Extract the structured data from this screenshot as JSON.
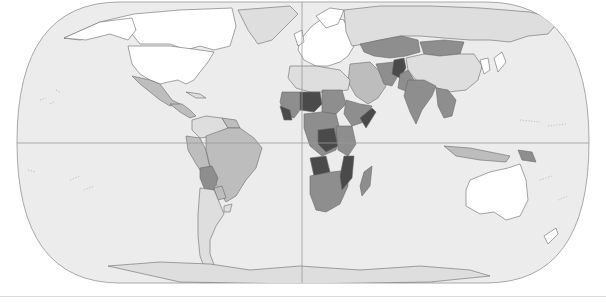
{
  "map": {
    "type": "choropleth",
    "projection": "robinson",
    "colors": {
      "ocean": "#ececec",
      "outline": "#a8a8a8",
      "graticule": "#9a9a9a",
      "border": "#6a6a6a",
      "class_1": "#ffffff",
      "class_2": "#dedede",
      "class_3": "#bdbdbd",
      "class_4": "#8e8e8e",
      "class_5": "#4a4a4a"
    },
    "equator_y": 143,
    "prime_meridian_x": 302,
    "regions": [
      {
        "name": "greenland",
        "class": "class_2",
        "d": "M238,10 L290,6 L298,14 L286,26 L272,40 L258,44 L248,30 Z"
      },
      {
        "name": "canada",
        "class": "class_1",
        "d": "M64,38 L100,22 L134,14 L180,10 L232,8 L236,26 L230,46 L214,50 L200,46 L186,50 L170,44 L140,44 L132,34 L110,32 L80,40 Z"
      },
      {
        "name": "alaska",
        "class": "class_1",
        "d": "M64,38 L100,22 L132,18 L136,30 L128,40 L110,34 L86,40 Z"
      },
      {
        "name": "usa",
        "class": "class_1",
        "d": "M128,46 L170,46 L200,50 L214,52 L208,62 L200,72 L194,80 L186,84 L178,80 L168,82 L160,84 L150,80 L140,74 L132,64 Z"
      },
      {
        "name": "mexico",
        "class": "class_3",
        "d": "M132,76 L150,80 L160,84 L166,92 L172,100 L180,104 L170,106 L160,100 L150,92 L140,84 Z"
      },
      {
        "name": "central-america",
        "class": "class_3",
        "d": "M170,104 L182,104 L190,110 L196,116 L190,118 L180,112 Z"
      },
      {
        "name": "cuba-caribbean",
        "class": "class_2",
        "d": "M186,92 L200,94 L206,98 L196,98 Z"
      },
      {
        "name": "colombia-venezuela",
        "class": "class_2",
        "d": "M192,120 L206,116 L222,118 L228,128 L214,136 L200,138 L192,130 Z"
      },
      {
        "name": "guianas",
        "class": "class_3",
        "d": "M222,118 L236,120 L240,128 L228,128 Z"
      },
      {
        "name": "ecuador-peru",
        "class": "class_3",
        "d": "M186,136 L200,138 L206,150 L210,168 L204,176 L196,164 L188,150 Z"
      },
      {
        "name": "brazil",
        "class": "class_3",
        "d": "M206,136 L228,128 L240,128 L254,138 L262,148 L256,168 L246,180 L236,196 L226,202 L218,190 L214,176 L210,166 L206,150 Z"
      },
      {
        "name": "bolivia",
        "class": "class_4",
        "d": "M200,168 L212,166 L218,178 L214,190 L204,188 L200,178 Z"
      },
      {
        "name": "paraguay",
        "class": "class_3",
        "d": "M214,188 L222,186 L226,198 L218,200 Z"
      },
      {
        "name": "uruguay",
        "class": "class_2",
        "d": "M224,206 L232,204 L230,212 L224,212 Z"
      },
      {
        "name": "argentina-chile",
        "class": "class_2",
        "d": "M200,188 L214,190 L220,204 L224,214 L216,226 L210,240 L210,254 L216,270 L206,272 L200,256 L198,236 L198,214 Z"
      },
      {
        "name": "europe",
        "class": "class_1",
        "d": "M300,40 L312,26 L326,16 L344,20 L350,34 L354,46 L348,56 L340,62 L328,66 L316,66 L304,60 L298,50 Z"
      },
      {
        "name": "uk-ireland",
        "class": "class_1",
        "d": "M294,34 L302,30 L304,42 L298,46 Z"
      },
      {
        "name": "scandinavia",
        "class": "class_1",
        "d": "M316,16 L330,8 L344,10 L338,24 L326,28 Z"
      },
      {
        "name": "russia",
        "class": "class_2",
        "d": "M344,10 L380,6 L430,6 L480,8 L530,12 L560,20 L548,34 L528,36 L510,42 L490,40 L470,40 L444,38 L420,36 L400,36 L380,40 L364,44 L352,46 L346,32 Z"
      },
      {
        "name": "kazakhstan",
        "class": "class_4",
        "d": "M360,44 L380,40 L402,36 L418,40 L420,52 L406,56 L390,58 L374,56 L364,52 Z"
      },
      {
        "name": "mongolia",
        "class": "class_4",
        "d": "M420,42 L444,40 L464,42 L460,54 L440,56 L424,54 Z"
      },
      {
        "name": "china",
        "class": "class_2",
        "d": "M406,58 L424,54 L440,56 L460,54 L474,54 L482,66 L478,80 L466,90 L448,92 L432,86 L416,80 L408,70 Z"
      },
      {
        "name": "korea-japan",
        "class": "class_1",
        "d": "M480,60 L488,58 L490,70 L484,74 Z M494,58 L502,52 L506,62 L498,72 Z"
      },
      {
        "name": "middle-east",
        "class": "class_3",
        "d": "M350,64 L370,62 L380,72 L386,86 L378,98 L368,104 L356,96 L348,82 Z"
      },
      {
        "name": "iran",
        "class": "class_4",
        "d": "M376,64 L394,62 L398,76 L392,86 L384,84 Z"
      },
      {
        "name": "afghanistan",
        "class": "class_5",
        "d": "M394,60 L404,58 L406,68 L400,78 L392,74 Z"
      },
      {
        "name": "pakistan",
        "class": "class_4",
        "d": "M400,74 L408,70 L414,80 L408,92 L398,88 Z"
      },
      {
        "name": "india",
        "class": "class_4",
        "d": "M408,80 L424,80 L436,86 L432,96 L422,110 L416,124 L410,112 L404,96 Z"
      },
      {
        "name": "southeast-asia",
        "class": "class_4",
        "d": "M436,88 L448,90 L456,100 L452,116 L444,118 L438,106 Z"
      },
      {
        "name": "indonesia",
        "class": "class_3",
        "d": "M444,146 L470,148 L490,152 L510,156 L506,162 L480,160 L456,156 Z"
      },
      {
        "name": "papua-new-guinea",
        "class": "class_4",
        "d": "M518,150 L532,152 L536,162 L522,160 Z"
      },
      {
        "name": "australia",
        "class": "class_1",
        "d": "M470,180 L490,172 L508,168 L520,164 L526,180 L528,200 L520,216 L506,220 L494,212 L480,214 L466,206 L466,190 Z"
      },
      {
        "name": "new-zealand",
        "class": "class_1",
        "d": "M544,236 L556,228 L558,234 L548,244 Z"
      },
      {
        "name": "north-africa",
        "class": "class_2",
        "d": "M290,66 L316,66 L340,70 L350,80 L348,90 L330,92 L310,92 L296,88 L288,78 Z"
      },
      {
        "name": "sahel-west",
        "class": "class_5",
        "d": "M300,92 L320,92 L322,104 L314,112 L300,110 Z"
      },
      {
        "name": "west-africa",
        "class": "class_4",
        "d": "M282,92 L300,92 L300,110 L294,118 L284,114 L280,102 Z"
      },
      {
        "name": "west-africa-coast",
        "class": "class_5",
        "d": "M280,106 L290,110 L292,120 L284,120 Z"
      },
      {
        "name": "central-north-africa",
        "class": "class_4",
        "d": "M322,90 L342,90 L346,104 L336,114 L322,112 Z"
      },
      {
        "name": "horn-of-africa",
        "class": "class_4",
        "d": "M346,100 L360,104 L372,106 L364,122 L352,126 L344,114 Z"
      },
      {
        "name": "somalia",
        "class": "class_5",
        "d": "M360,118 L372,108 L376,112 L366,128 Z"
      },
      {
        "name": "central-africa",
        "class": "class_4",
        "d": "M304,114 L322,112 L336,114 L340,130 L336,150 L322,156 L310,146 L304,128 Z"
      },
      {
        "name": "drc",
        "class": "class_5",
        "d": "M318,130 L334,128 L338,146 L326,152 L318,144 Z"
      },
      {
        "name": "east-africa",
        "class": "class_4",
        "d": "M336,126 L352,126 L356,144 L348,156 L338,150 Z"
      },
      {
        "name": "angola",
        "class": "class_5",
        "d": "M310,158 L326,156 L330,172 L314,176 Z"
      },
      {
        "name": "southern-africa",
        "class": "class_4",
        "d": "M310,176 L332,172 L348,170 L348,186 L340,204 L326,212 L316,210 L310,194 Z"
      },
      {
        "name": "mozambique",
        "class": "class_5",
        "d": "M344,156 L354,156 L352,178 L342,190 L340,176 Z"
      },
      {
        "name": "madagascar",
        "class": "class_4",
        "d": "M364,172 L372,166 L370,186 L362,196 L360,186 Z"
      },
      {
        "name": "antarctica",
        "class": "class_2",
        "d": "M108,266 L160,262 L210,264 L250,270 L300,266 L360,270 L420,266 L470,270 L490,276 L430,282 L300,284 L180,282 Z"
      }
    ],
    "islands": [
      "M40,100 L46,98 M50,104 L54,102",
      "M56,90 L60,92",
      "M28,170 L36,172 M70,180 L80,176 M84,190 L94,186",
      "M520,120 L540,122 M548,126 L566,124",
      "M540,180 L552,176 M558,200 L568,196"
    ]
  }
}
